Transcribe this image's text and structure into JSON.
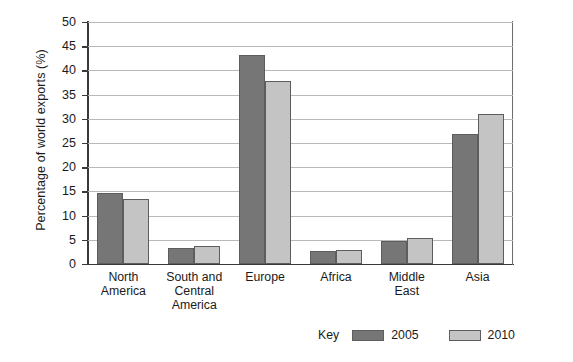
{
  "chart_data": {
    "type": "bar",
    "title": "",
    "xlabel": "",
    "ylabel": "Percentage of world exports (%)",
    "ylim": [
      0,
      50
    ],
    "ytick_step": 5,
    "yticks": [
      "50",
      "45",
      "40",
      "35",
      "30",
      "25",
      "20",
      "15",
      "10",
      "5",
      "0"
    ],
    "grid": true,
    "legend_position": "bottom-right",
    "legend_title": "Key",
    "categories": [
      "North\nAmerica",
      "South and\nCentral\nAmerica",
      "Europe",
      "Africa",
      "Middle\nEast",
      "Asia"
    ],
    "category_labels": [
      [
        "North",
        "America"
      ],
      [
        "South and",
        "Central",
        "America"
      ],
      [
        "Europe"
      ],
      [
        "Africa"
      ],
      [
        "Middle",
        "East"
      ],
      [
        "Asia"
      ]
    ],
    "series": [
      {
        "name": "2005",
        "color": "#767676",
        "values": [
          14.6,
          3.4,
          43.2,
          2.6,
          4.8,
          26.8
        ]
      },
      {
        "name": "2010",
        "color": "#c4c4c4",
        "values": [
          13.4,
          3.7,
          37.8,
          2.9,
          5.3,
          31.0
        ]
      }
    ]
  },
  "colors": {
    "series_2005": "#767676",
    "series_2010": "#c4c4c4",
    "axis": "#3a3a3a",
    "grid": "#b9b9b9",
    "text": "#1b1b1b",
    "background": "#ffffff"
  }
}
